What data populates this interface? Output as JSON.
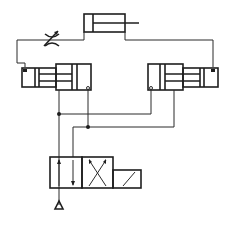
{
  "diagram": {
    "title": "",
    "type": "pneumatic/hydraulic circuit schematic",
    "colors": {
      "line": "#2b2b2b",
      "background": "#ffffff"
    },
    "components": [
      {
        "id": "top-cylinder",
        "kind": "single-rod cylinder",
        "position": "top-center"
      },
      {
        "id": "throttle-valve",
        "kind": "adjustable flow restrictor",
        "position": "top-left line"
      },
      {
        "id": "left-cylinder",
        "kind": "double-acting cylinder with cushion",
        "position": "middle-left"
      },
      {
        "id": "right-cylinder",
        "kind": "double-acting cylinder with cushion",
        "position": "middle-right"
      },
      {
        "id": "directional-valve",
        "kind": "4/2 directional control valve, solenoid actuated",
        "position": "bottom-center"
      },
      {
        "id": "tank",
        "kind": "exhaust/tank symbol",
        "position": "bottom-left"
      }
    ],
    "junctions": 2,
    "labels": []
  }
}
